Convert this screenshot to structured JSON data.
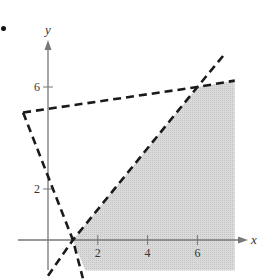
{
  "figure": {
    "bullet": "•",
    "x_axis_label": "x",
    "y_axis_label": "y",
    "x_ticks": [
      {
        "value": 2,
        "label": "2"
      },
      {
        "value": 4,
        "label": "4"
      },
      {
        "value": 6,
        "label": "6"
      }
    ],
    "y_ticks": [
      {
        "value": 2,
        "label": "2"
      },
      {
        "value": 6,
        "label": "6"
      }
    ],
    "colors": {
      "shade": "#d4d4d4",
      "axis": "#777777",
      "boundary": "#1a1a1a"
    }
  },
  "chart_data": {
    "type": "area",
    "title": "",
    "xlabel": "x",
    "ylabel": "y",
    "xlim": [
      -1.2,
      8
    ],
    "ylim": [
      -1.4,
      8.5
    ],
    "grid": false,
    "legend": null,
    "boundary_lines": [
      {
        "name": "top line",
        "style": "dashed",
        "equation": "y = x/6 + 5",
        "points": [
          [
            -1,
            5
          ],
          [
            6,
            6
          ],
          [
            7.5,
            6.25
          ]
        ]
      },
      {
        "name": "steep line",
        "style": "dashed",
        "equation": "y = -2.5x + 2.5",
        "points": [
          [
            -1,
            5
          ],
          [
            1,
            0
          ],
          [
            1.4,
            -1.5
          ]
        ]
      },
      {
        "name": "rising line",
        "style": "dashed",
        "equation": "y = 1.2x - 1.2",
        "points": [
          [
            0,
            -1.4
          ],
          [
            1,
            0
          ],
          [
            6,
            6
          ],
          [
            7.1,
            7.3
          ]
        ]
      }
    ],
    "shaded_region": {
      "description": "Feasible region below top line, right of rising line, right of steep line",
      "vertices": [
        [
          1,
          0
        ],
        [
          6,
          6
        ],
        [
          7.5,
          6.25
        ],
        [
          7.5,
          -1.2
        ],
        [
          1.5,
          -1.2
        ]
      ]
    },
    "vertices_of_interest": [
      [
        -1,
        5
      ],
      [
        1,
        0
      ],
      [
        6,
        6
      ]
    ],
    "x_ticks": [
      2,
      4,
      6
    ],
    "y_ticks": [
      2,
      6
    ]
  }
}
